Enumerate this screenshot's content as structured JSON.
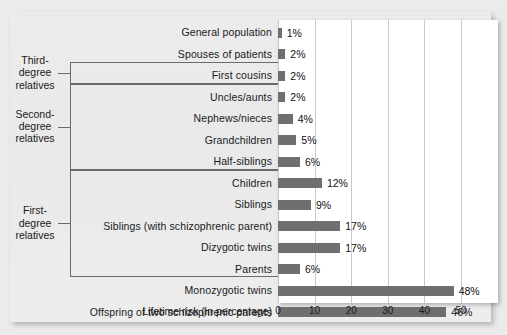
{
  "chart_data": {
    "type": "bar",
    "orientation": "horizontal",
    "title": "",
    "xlabel": "Lifetime risk (in percentage)",
    "ylabel": "",
    "xlim": [
      0,
      55
    ],
    "xticks": [
      0,
      10,
      20,
      30,
      40,
      50
    ],
    "xtick_labels": [
      "0",
      "10",
      "20",
      "30",
      "40",
      "50"
    ],
    "grid": "vertical",
    "legend": "none",
    "bar_color": "#6f6f6f",
    "categories": [
      "General population",
      "Spouses of patients",
      "First cousins",
      "Uncles/aunts",
      "Nephews/nieces",
      "Grandchildren",
      "Half-siblings",
      "Children",
      "Siblings",
      "Siblings (with schizophrenic parent)",
      "Dizygotic twins",
      "Parents",
      "Monozygotic twins",
      "Offspring of two schizophrenic parents"
    ],
    "values": [
      1,
      2,
      2,
      2,
      4,
      5,
      6,
      12,
      9,
      17,
      17,
      6,
      48,
      46
    ],
    "value_labels": [
      "1%",
      "2%",
      "2%",
      "2%",
      "4%",
      "5%",
      "6%",
      "12%",
      "9%",
      "17%",
      "17%",
      "6%",
      "48%",
      "46%"
    ],
    "groups": [
      {
        "label": "Third-\ndegree\nrelatives",
        "lines": [
          "Third-",
          "degree",
          "relatives"
        ],
        "first_index": 2,
        "last_index": 2
      },
      {
        "label": "Second-\ndegree\nrelatives",
        "lines": [
          "Second-",
          "degree",
          "relatives"
        ],
        "first_index": 3,
        "last_index": 6
      },
      {
        "label": "First-\ndegree\nrelatives",
        "lines": [
          "First-",
          "degree",
          "relatives"
        ],
        "first_index": 7,
        "last_index": 11
      }
    ]
  }
}
